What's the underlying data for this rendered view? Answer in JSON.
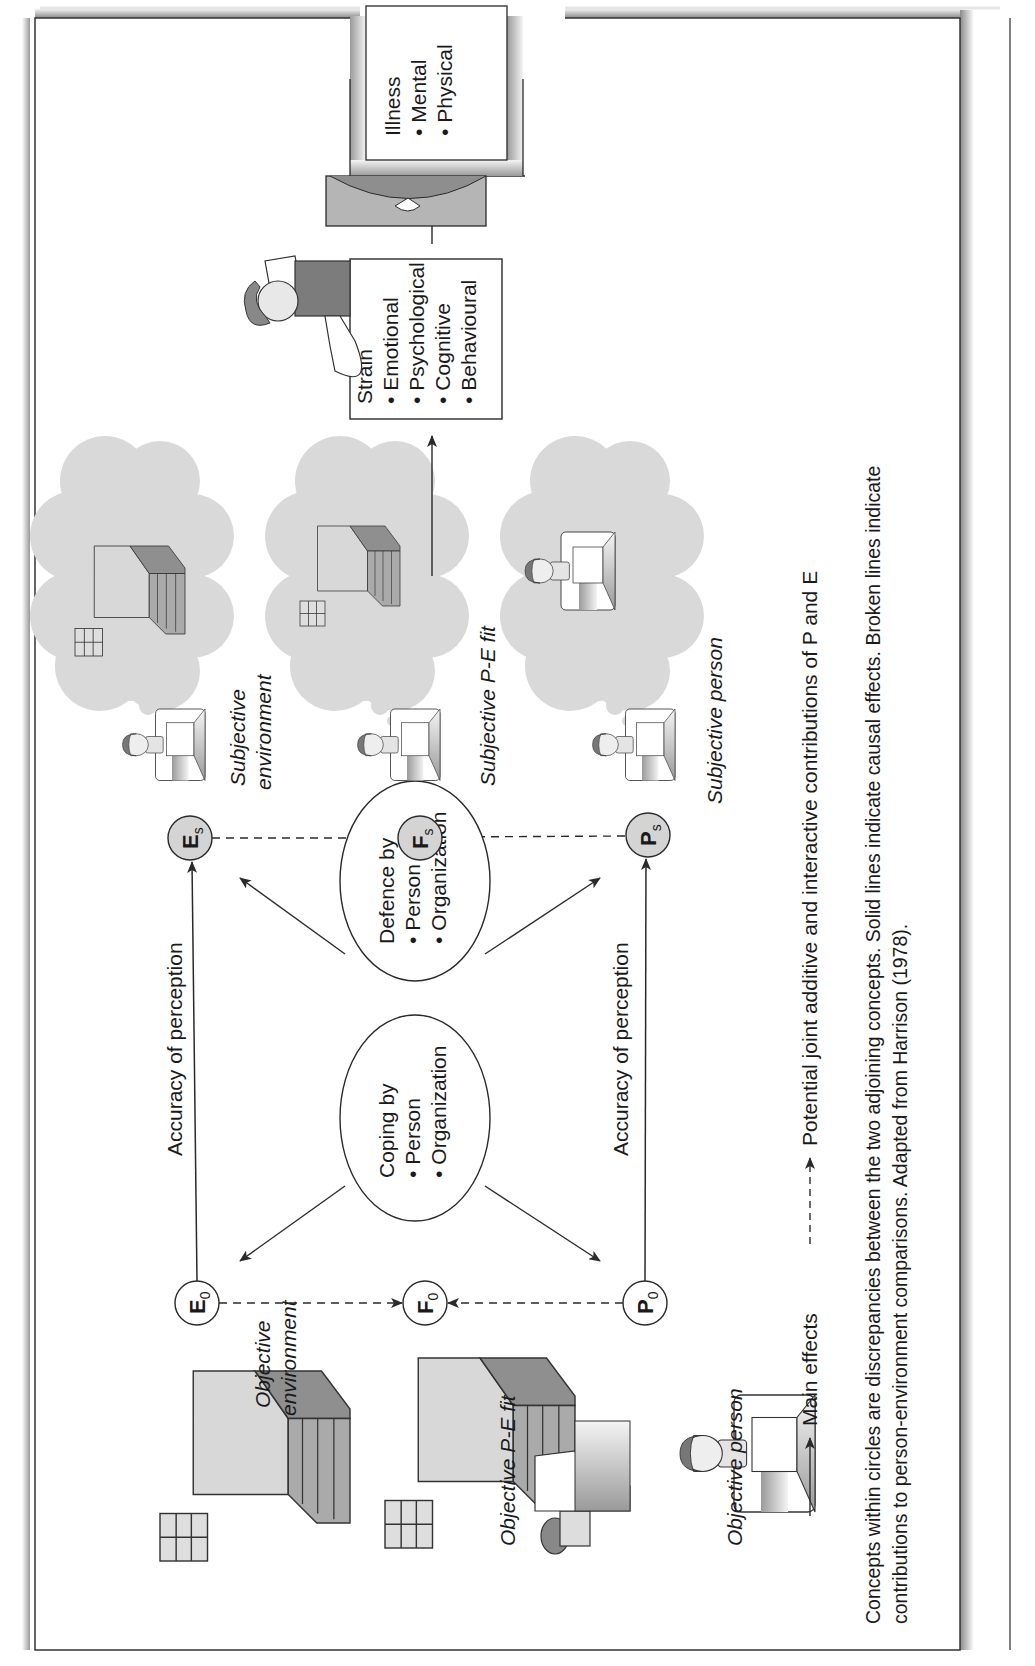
{
  "figure": {
    "nodes": {
      "E0": {
        "letter": "E",
        "sub": "0",
        "fill": "#ffffff"
      },
      "F0": {
        "letter": "F",
        "sub": "0",
        "fill": "#ffffff"
      },
      "P0": {
        "letter": "P",
        "sub": "0",
        "fill": "#ffffff"
      },
      "Es": {
        "letter": "E",
        "sub": "s",
        "fill": "#d4d4d4"
      },
      "Fs": {
        "letter": "F",
        "sub": "s",
        "fill": "#d4d4d4"
      },
      "Ps": {
        "letter": "P",
        "sub": "s",
        "fill": "#d4d4d4"
      }
    },
    "labels": {
      "objective_environment": [
        "Objective",
        "environment"
      ],
      "objective_pe_fit": "Objective P-E fit",
      "objective_person": "Objective person",
      "subjective_environment": [
        "Subjective",
        "environment"
      ],
      "subjective_pe_fit": "Subjective P-E fit",
      "subjective_person": "Subjective person",
      "accuracy_top": "Accuracy of perception",
      "accuracy_bottom": "Accuracy of perception"
    },
    "coping": {
      "title": "Coping by",
      "items": [
        "Person",
        "Organization"
      ]
    },
    "defence": {
      "title": "Defence by",
      "items": [
        "Person",
        "Organization"
      ]
    },
    "strain": {
      "title": "Strain",
      "items": [
        "Emotional",
        "Psychological",
        "Cognitive",
        "Behavioural"
      ]
    },
    "illness": {
      "title": "Illness",
      "items": [
        "Mental",
        "Physical"
      ]
    },
    "bullet": "•",
    "legend": {
      "main_effects": "Main effects",
      "joint_effects": "Potential joint additive and interactive contributions of P and E"
    },
    "caption": [
      "Concepts within circles are discrepancies between the two adjoining concepts. Solid lines indicate causal effects. Broken lines indicate",
      "contributions to person-environment comparisons. Adapted from Harrison (1978)."
    ],
    "colors": {
      "line": "#2a2a2a",
      "subjective_fill": "#d4d4d4",
      "cloud": "#d9d9d9",
      "frame_shadow": "#9a9a9a"
    }
  }
}
